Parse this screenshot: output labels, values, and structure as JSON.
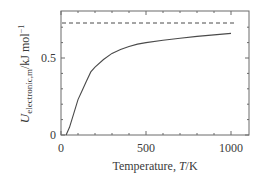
{
  "chart_data": {
    "type": "line",
    "title": "",
    "xlabel": "Temperature, T/K",
    "ylabel": "U_electronic,m/kJ mol^-1",
    "xlim": [
      0,
      1000
    ],
    "ylim": [
      0,
      0.8
    ],
    "x_ticks": [
      0,
      500,
      1000
    ],
    "y_ticks": [
      0,
      0.5
    ],
    "grid": false,
    "legend": null,
    "series": [
      {
        "name": "U_electronic,m",
        "style": "solid",
        "x": [
          30,
          50,
          75,
          100,
          125,
          150,
          175,
          200,
          250,
          300,
          350,
          400,
          450,
          500,
          600,
          700,
          800,
          900,
          1000
        ],
        "y": [
          0.0,
          0.05,
          0.14,
          0.23,
          0.29,
          0.35,
          0.41,
          0.44,
          0.49,
          0.53,
          0.555,
          0.575,
          0.59,
          0.6,
          0.615,
          0.628,
          0.64,
          0.65,
          0.66
        ]
      },
      {
        "name": "high-temperature limit",
        "style": "dashed",
        "x": [
          0,
          1030
        ],
        "y": [
          0.727,
          0.727
        ]
      }
    ]
  },
  "axes": {
    "x_tick_labels": [
      "0",
      "500",
      "1000"
    ],
    "y_tick_labels": [
      "0",
      "0.5"
    ],
    "xlabel_text": "Temperature, ",
    "xlabel_italic": "T",
    "xlabel_unit": "/K",
    "ylabel_main": "U",
    "ylabel_sub": "electronic,m",
    "ylabel_unit": "/kJ mol",
    "ylabel_sup": "−1"
  },
  "colors": {
    "line": "#4a4a4a",
    "axis": "#6a6a6a"
  }
}
